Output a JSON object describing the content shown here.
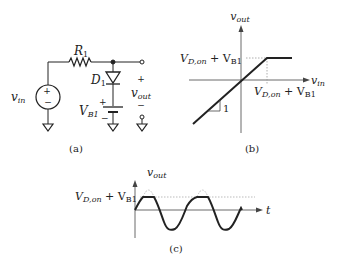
{
  "circuit": {
    "source_label": "v",
    "source_sub": "in",
    "resistor_label": "R",
    "resistor_sub": "1",
    "diode_label": "D",
    "diode_sub": "1",
    "battery_label": "V",
    "battery_sub": "B1",
    "battery_plus": "+",
    "battery_minus": "−",
    "source_plus": "+",
    "source_minus": "−",
    "out_plus": "+",
    "out_minus": "−",
    "out_label": "v",
    "out_sub": "out",
    "caption": "(a)"
  },
  "transfer": {
    "y_label": "v",
    "y_sub": "out",
    "x_label": "v",
    "x_sub": "in",
    "level_label_main": "V",
    "level_label_sub1": "D,on",
    "level_label_mid": " + V",
    "level_label_sub2": "B1",
    "slope_label": "1",
    "caption": "(b)"
  },
  "waveform": {
    "y_label": "v",
    "y_sub": "out",
    "x_label": "t",
    "level_label_main": "V",
    "level_label_sub1": "D,on",
    "level_label_mid": " + V",
    "level_label_sub2": "B1",
    "caption": "(c)"
  },
  "colors": {
    "line": "#222222",
    "dotted": "#999999"
  }
}
